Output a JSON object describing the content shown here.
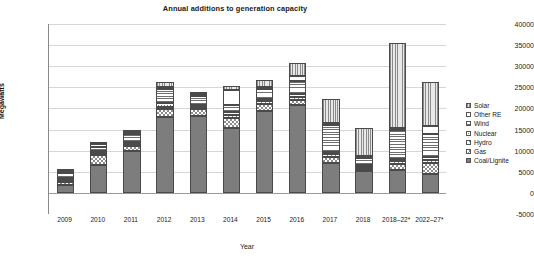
{
  "chart_data": {
    "type": "bar",
    "subtype": "stacked-bar",
    "title": "Annual additions to generation capacity",
    "xlabel": "Year",
    "ylabel": "Megawatts",
    "ylim": [
      -5000,
      40000
    ],
    "ytick_step": 5000,
    "yticks": [
      "40000",
      "35000",
      "30000",
      "25000",
      "20000",
      "15000",
      "10000",
      "5000",
      "0",
      "-5000"
    ],
    "ytick_values": [
      40000,
      35000,
      30000,
      25000,
      20000,
      15000,
      10000,
      5000,
      0,
      -5000
    ],
    "grid": true,
    "legend_position": "right",
    "categories": [
      "2009",
      "2010",
      "2011",
      "2012",
      "2013",
      "2014",
      "2015",
      "2016",
      "2017",
      "2018",
      "2018–22*",
      "2022–27*"
    ],
    "series": [
      {
        "name": "Coal/Lignite",
        "pattern": "solid-gray",
        "values": [
          1800,
          6500,
          9900,
          18000,
          18300,
          15300,
          19500,
          20800,
          7200,
          5200,
          5500,
          4500
        ]
      },
      {
        "name": "Gas",
        "pattern": "checkerboard",
        "values": [
          900,
          2400,
          1300,
          1900,
          1600,
          2500,
          1500,
          1300,
          1200,
          300,
          1300,
          2500
        ]
      },
      {
        "name": "Hydro",
        "pattern": "diagonal-hatch",
        "values": [
          400,
          300,
          500,
          500,
          400,
          600,
          700,
          600,
          700,
          500,
          700,
          800
        ]
      },
      {
        "name": "Nuclear",
        "pattern": "dotted",
        "values": [
          200,
          500,
          300,
          1000,
          400,
          700,
          600,
          800,
          600,
          300,
          500,
          700
        ]
      },
      {
        "name": "Wind",
        "pattern": "horizontal-stripes",
        "values": [
          1000,
          900,
          1700,
          3300,
          2100,
          1800,
          2400,
          3000,
          6400,
          1600,
          6800,
          5500
        ]
      },
      {
        "name": "Other RE",
        "pattern": "white",
        "values": [
          200,
          700,
          300,
          500,
          300,
          3500,
          300,
          1300,
          300,
          200,
          400,
          1900
        ]
      },
      {
        "name": "Solar",
        "pattern": "vertical-stripes",
        "values": [
          300,
          200,
          400,
          1000,
          500,
          900,
          1600,
          3000,
          5700,
          6700,
          20300,
          10400
        ]
      }
    ],
    "series_order_bottom_to_top": [
      "Coal/Lignite",
      "Gas",
      "Hydro",
      "Nuclear",
      "Wind",
      "Other RE",
      "Solar"
    ],
    "totals": [
      4800,
      11500,
      14400,
      26200,
      23600,
      25300,
      26600,
      30800,
      22100,
      14800,
      35500,
      26300
    ],
    "note": "Last two categories are projections marked with asterisk"
  },
  "legend": {
    "items": [
      {
        "label": "Solar",
        "pattern": "vertical-stripes"
      },
      {
        "label": "Other RE",
        "pattern": "white"
      },
      {
        "label": "Wind",
        "pattern": "horizontal-stripes"
      },
      {
        "label": "Nuclear",
        "pattern": "dotted"
      },
      {
        "label": "Hydro",
        "pattern": "diagonal-hatch"
      },
      {
        "label": "Gas",
        "pattern": "checkerboard"
      },
      {
        "label": "Coal/Lignite",
        "pattern": "solid-gray"
      }
    ]
  }
}
